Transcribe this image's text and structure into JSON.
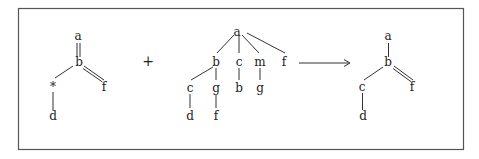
{
  "diagram": {
    "operator_plus": "+",
    "arrow": "→",
    "left_tree": {
      "nodes": [
        {
          "id": "a",
          "label": "a",
          "x": 78,
          "y": 40
        },
        {
          "id": "b",
          "label": "b",
          "x": 78,
          "y": 66
        },
        {
          "id": "f",
          "label": "f",
          "x": 104,
          "y": 90
        },
        {
          "id": "star",
          "label": "*",
          "x": 52,
          "y": 91
        },
        {
          "id": "d",
          "label": "d",
          "x": 52,
          "y": 120
        }
      ],
      "edges": [
        {
          "from": "a",
          "to": "b",
          "type": "double"
        },
        {
          "from": "b",
          "to": "f",
          "type": "double"
        },
        {
          "from": "b",
          "to": "star",
          "type": "single"
        },
        {
          "from": "star",
          "to": "d",
          "type": "single"
        }
      ]
    },
    "middle_tree": {
      "nodes": [
        {
          "id": "a",
          "label": "a",
          "x": 236,
          "y": 35
        },
        {
          "id": "b",
          "label": "b",
          "x": 215,
          "y": 65
        },
        {
          "id": "c",
          "label": "c",
          "x": 239,
          "y": 65
        },
        {
          "id": "m",
          "label": "m",
          "x": 260,
          "y": 65
        },
        {
          "id": "f",
          "label": "f",
          "x": 284,
          "y": 65
        },
        {
          "id": "c2",
          "label": "c",
          "x": 189,
          "y": 92
        },
        {
          "id": "g",
          "label": "g",
          "x": 215,
          "y": 92
        },
        {
          "id": "b2",
          "label": "b",
          "x": 239,
          "y": 91
        },
        {
          "id": "g2",
          "label": "g",
          "x": 260,
          "y": 92
        },
        {
          "id": "d",
          "label": "d",
          "x": 189,
          "y": 119
        },
        {
          "id": "f2",
          "label": "f",
          "x": 215,
          "y": 119
        }
      ],
      "edges": [
        {
          "from": "a",
          "to": "b"
        },
        {
          "from": "a",
          "to": "c"
        },
        {
          "from": "a",
          "to": "m"
        },
        {
          "from": "a",
          "to": "f"
        },
        {
          "from": "b",
          "to": "c2"
        },
        {
          "from": "b",
          "to": "g"
        },
        {
          "from": "c",
          "to": "b2"
        },
        {
          "from": "m",
          "to": "g2"
        },
        {
          "from": "c2",
          "to": "d"
        },
        {
          "from": "g",
          "to": "f2"
        }
      ]
    },
    "right_tree": {
      "nodes": [
        {
          "id": "a",
          "label": "a",
          "x": 388,
          "y": 40
        },
        {
          "id": "b",
          "label": "b",
          "x": 388,
          "y": 66
        },
        {
          "id": "f",
          "label": "f",
          "x": 412,
          "y": 90
        },
        {
          "id": "c",
          "label": "c",
          "x": 362,
          "y": 91
        },
        {
          "id": "d",
          "label": "d",
          "x": 362,
          "y": 119
        }
      ],
      "edges": [
        {
          "from": "a",
          "to": "b",
          "type": "single"
        },
        {
          "from": "b",
          "to": "f",
          "type": "double"
        },
        {
          "from": "b",
          "to": "c",
          "type": "single"
        },
        {
          "from": "c",
          "to": "d",
          "type": "single"
        }
      ]
    }
  }
}
